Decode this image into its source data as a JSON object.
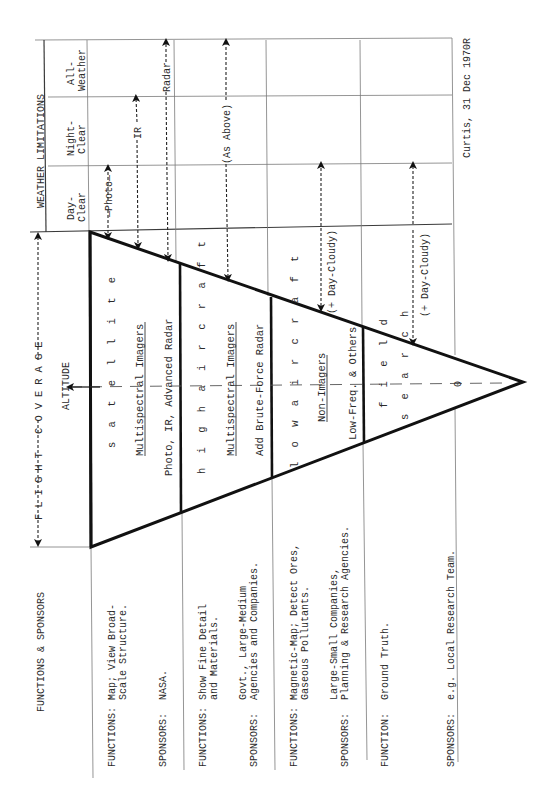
{
  "header": {
    "functions_sponsors": "FUNCTIONS & SPONSORS",
    "flight_coverage": "FLIGHT COVERAGE",
    "altitude": "ALTITUDE",
    "weather_limitations": "WEATHER LIMITATIONS"
  },
  "weather_columns": [
    {
      "label_line1": "Day-",
      "label_line2": "Clear"
    },
    {
      "label_line1": "Night-",
      "label_line2": "Clear"
    },
    {
      "label_line1": "All-",
      "label_line2": "Weather"
    }
  ],
  "weather_arrows": [
    {
      "label": "—Photo—",
      "reach": "Day-Clear"
    },
    {
      "label": "IR",
      "reach": "Night-Clear"
    },
    {
      "label": "Radar",
      "reach": "All-Weather"
    },
    {
      "label": "(As Above)",
      "reach": "All-Weather"
    },
    {
      "label": "(+ Day-Cloudy)",
      "reach": "Day-Clear"
    },
    {
      "label": "(+ Day-Cloudy)",
      "reach": "Day-Clear"
    }
  ],
  "tiers": [
    {
      "platform": "s a t e l l i t e",
      "sensor_heading": "Multispectral Imagers",
      "sensor_detail": "Photo, IR, Advanced Radar",
      "functions_label": "FUNCTIONS:",
      "functions": [
        "Map; View Broad-",
        "Scale Structure."
      ],
      "sponsors_label": "SPONSORS:",
      "sponsors": [
        "NASA."
      ]
    },
    {
      "platform": "h i g h   a i r c r a f t",
      "sensor_heading": "Multispectral Imagers",
      "sensor_detail": "Add Brute-Force Radar",
      "functions_label": "FUNCTIONS:",
      "functions": [
        "Show Fine Detail",
        "and Materials."
      ],
      "sponsors_label": "SPONSORS:",
      "sponsors": [
        "Govt., Large-Medium",
        "Agencies and Companies."
      ]
    },
    {
      "platform": "l o w   a i r c r a f t",
      "sensor_heading": "Non-Imagers",
      "sensor_detail": "Low-Freq. & Others",
      "functions_label": "FUNCTIONS:",
      "functions": [
        "Magnetic-Map; Detect Ores,",
        "Gaseous Pollutants."
      ],
      "sponsors_label": "SPONSORS:",
      "sponsors": [
        "Large-Small Companies,",
        "Planning & Research Agencies."
      ]
    },
    {
      "platform_line1": "f i e l d",
      "platform_line2": "s e a r c h",
      "apex_value": "0",
      "functions_label": "FUNCTION:",
      "functions": [
        "Ground Truth."
      ],
      "sponsors_label": "SPONSORS:",
      "sponsors": [
        "e.g. Local Research Team."
      ]
    }
  ],
  "footer": {
    "attribution": "Curtis, 31 Dec 1970R"
  },
  "colors": {
    "ink": "#111111",
    "grid": "#7a7a7a",
    "paper": "#ffffff"
  }
}
